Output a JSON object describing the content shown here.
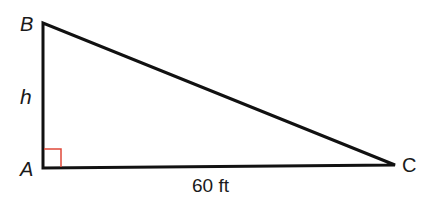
{
  "diagram": {
    "type": "right-triangle",
    "vertices": {
      "A": {
        "label": "A",
        "x": 43,
        "y": 168
      },
      "B": {
        "label": "B",
        "x": 43,
        "y": 23
      },
      "C": {
        "label": "C",
        "x": 395,
        "y": 165
      }
    },
    "side_labels": {
      "AB": "h",
      "AC": "60 ft"
    },
    "right_angle_at": "A",
    "colors": {
      "stroke": "#111111",
      "right_angle_marker": "#e0483a",
      "text": "#1a1a1a"
    }
  }
}
